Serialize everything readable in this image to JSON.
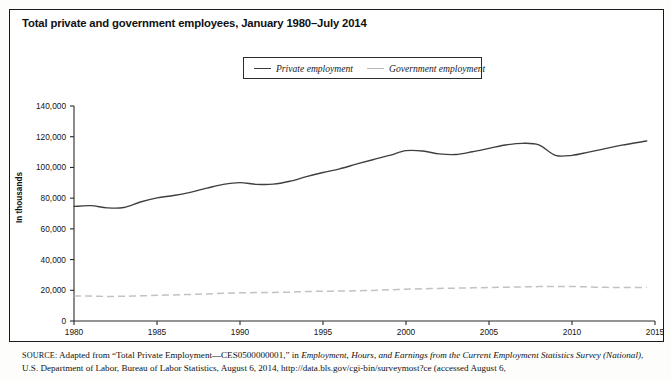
{
  "figure": {
    "title": "Total private and government employees, January 1980–July 2014",
    "y_axis_title": "In thousands"
  },
  "legend": {
    "position": "top-center",
    "items": [
      {
        "label": "Private employment",
        "key": "private",
        "color": "#3f3f3f",
        "style": "solid"
      },
      {
        "label": "Government employment",
        "key": "government",
        "color": "#c2c2c2",
        "style": "dashed"
      }
    ]
  },
  "source": {
    "label": "SOURCE:",
    "text_part1": " Adapted from “Total Private Employment—CES0500000001,” in ",
    "italic1": "Employment, Hours, and Earnings from the Current Employment Statistics Survey (National)",
    "text_part2": ", U.S. Department of Labor, Bureau of Labor Statistics, August 6, 2014, http://data.bls.gov/cgi-bin/surveymost?ce (accessed August 6,"
  },
  "chart_data": {
    "type": "line",
    "title": "Total private and government employees, January 1980–July 2014",
    "xlabel": "",
    "ylabel": "In thousands",
    "xlim": [
      1980,
      2015
    ],
    "ylim": [
      0,
      140000
    ],
    "ytick_labels": [
      "0",
      "20,000",
      "40,000",
      "60,000",
      "80,000",
      "100,000",
      "120,000",
      "140,000"
    ],
    "yticks": [
      0,
      20000,
      40000,
      60000,
      80000,
      100000,
      120000,
      140000
    ],
    "xticks": [
      1980,
      1985,
      1990,
      1995,
      2000,
      2005,
      2010,
      2015
    ],
    "xtick_labels": [
      "1980",
      "1985",
      "1990",
      "1995",
      "2000",
      "2005",
      "2010",
      "2015"
    ],
    "grid": false,
    "legend_position": "top-center",
    "x": [
      1980,
      1981,
      1982,
      1983,
      1984,
      1985,
      1986,
      1987,
      1988,
      1989,
      1990,
      1991,
      1992,
      1993,
      1994,
      1995,
      1996,
      1997,
      1998,
      1999,
      2000,
      2001,
      2002,
      2003,
      2004,
      2005,
      2006,
      2007,
      2008,
      2009,
      2010,
      2011,
      2012,
      2013,
      2014.5
    ],
    "series": [
      {
        "name": "Private employment",
        "key": "private",
        "color": "#3f3f3f",
        "style": "solid",
        "values": [
          74600,
          75100,
          73700,
          73900,
          77500,
          80200,
          81700,
          83800,
          86500,
          89000,
          90100,
          89000,
          89100,
          91000,
          94000,
          96700,
          99100,
          102100,
          105000,
          107800,
          110900,
          110700,
          108800,
          108400,
          110200,
          112400,
          114600,
          115700,
          114700,
          107900,
          107900,
          110000,
          112200,
          114500,
          117200
        ]
      },
      {
        "name": "Government employment",
        "key": "government",
        "color": "#c2c2c2",
        "style": "dashed",
        "values": [
          16200,
          16200,
          16000,
          16100,
          16400,
          16700,
          17000,
          17300,
          17600,
          18000,
          18400,
          18500,
          18600,
          18800,
          19200,
          19400,
          19500,
          19700,
          19900,
          20300,
          20700,
          21000,
          21200,
          21400,
          21600,
          21800,
          22000,
          22200,
          22400,
          22500,
          22500,
          22200,
          21900,
          21850,
          21900
        ]
      }
    ]
  }
}
